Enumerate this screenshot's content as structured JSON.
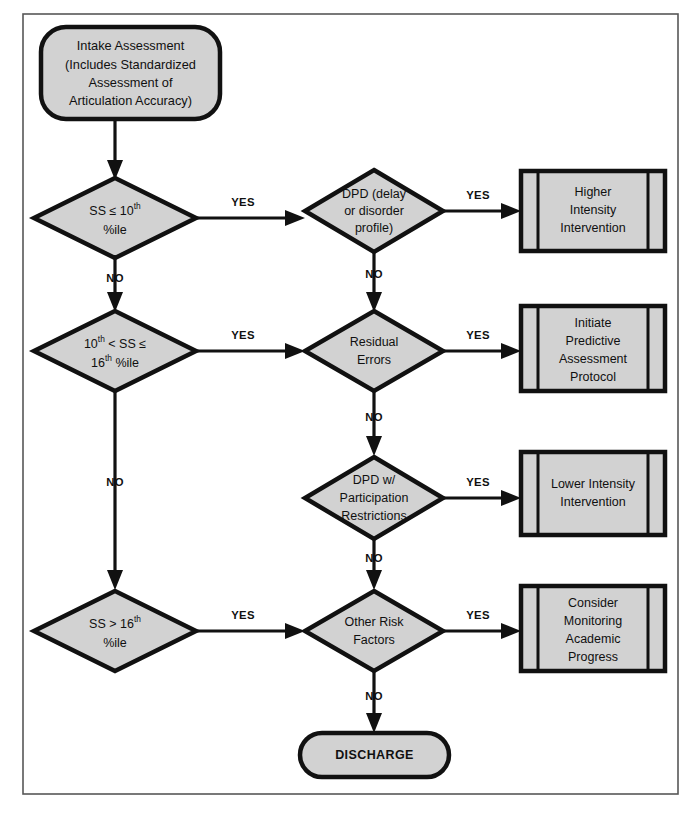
{
  "diagram": {
    "frame": {
      "stroke_color": "#575757"
    },
    "style": {
      "node_fill": "#d2d2d2",
      "node_stroke": "#111111",
      "background": "#ffffff",
      "edge_color": "#111111",
      "text_color": "#101010"
    },
    "nodes": [
      {
        "id": "intake",
        "type": "terminator",
        "lines": [
          "Intake Assessment",
          "(Includes Standardized",
          "Assessment of",
          "Articulation Accuracy)"
        ]
      },
      {
        "id": "d1",
        "type": "decision",
        "lines": [
          "SS ≤ 10th",
          "%ile"
        ],
        "rich": [
          {
            "parts": [
              {
                "t": "SS ≤ 10",
                "sup": false
              },
              {
                "t": "th",
                "sup": true
              }
            ]
          },
          {
            "parts": [
              {
                "t": "%ile",
                "sup": false
              }
            ]
          }
        ]
      },
      {
        "id": "d2",
        "type": "decision",
        "lines": [
          "DPD (delay",
          "or disorder",
          "profile)"
        ]
      },
      {
        "id": "p1",
        "type": "predefined-process",
        "lines": [
          "Higher",
          "Intensity",
          "Intervention"
        ]
      },
      {
        "id": "d3",
        "type": "decision",
        "lines": [
          "10th < SS ≤",
          "16th %ile"
        ],
        "rich": [
          {
            "parts": [
              {
                "t": "10",
                "sup": false
              },
              {
                "t": "th",
                "sup": true
              },
              {
                "t": " < SS ≤",
                "sup": false
              }
            ]
          },
          {
            "parts": [
              {
                "t": "16",
                "sup": false
              },
              {
                "t": "th",
                "sup": true
              },
              {
                "t": " %ile",
                "sup": false
              }
            ]
          }
        ]
      },
      {
        "id": "d4",
        "type": "decision",
        "lines": [
          "Residual",
          "Errors"
        ]
      },
      {
        "id": "p2",
        "type": "predefined-process",
        "lines": [
          "Initiate",
          "Predictive",
          "Assessment",
          "Protocol"
        ]
      },
      {
        "id": "d5",
        "type": "decision",
        "lines": [
          "DPD w/",
          "Participation",
          "Restrictions"
        ]
      },
      {
        "id": "p3",
        "type": "predefined-process",
        "lines": [
          "Lower Intensity",
          "Intervention"
        ]
      },
      {
        "id": "d6",
        "type": "decision",
        "lines": [
          "SS > 16th",
          "%ile"
        ],
        "rich": [
          {
            "parts": [
              {
                "t": "SS > 16",
                "sup": false
              },
              {
                "t": "th",
                "sup": true
              }
            ]
          },
          {
            "parts": [
              {
                "t": "%ile",
                "sup": false
              }
            ]
          }
        ]
      },
      {
        "id": "d7",
        "type": "decision",
        "lines": [
          "Other Risk",
          "Factors"
        ]
      },
      {
        "id": "p4",
        "type": "predefined-process",
        "lines": [
          "Consider",
          "Monitoring",
          "Academic",
          "Progress"
        ]
      },
      {
        "id": "discharge",
        "type": "terminator",
        "lines": [
          "DISCHARGE"
        ]
      }
    ],
    "edge_labels": {
      "yes": "YES",
      "no": "NO"
    },
    "edges": [
      {
        "from": "intake",
        "to": "d1",
        "label": ""
      },
      {
        "from": "d1",
        "to": "d2",
        "label": "YES"
      },
      {
        "from": "d2",
        "to": "p1",
        "label": "YES"
      },
      {
        "from": "d1",
        "to": "d3",
        "label": "NO"
      },
      {
        "from": "d2",
        "to": "d4",
        "label": "NO"
      },
      {
        "from": "d3",
        "to": "d4",
        "label": "YES"
      },
      {
        "from": "d4",
        "to": "p2",
        "label": "YES"
      },
      {
        "from": "d4",
        "to": "d5",
        "label": "NO"
      },
      {
        "from": "d5",
        "to": "p3",
        "label": "YES"
      },
      {
        "from": "d5",
        "to": "d7",
        "label": "NO"
      },
      {
        "from": "d3",
        "to": "d6",
        "label": "NO"
      },
      {
        "from": "d6",
        "to": "d7",
        "label": "YES"
      },
      {
        "from": "d7",
        "to": "p4",
        "label": "YES"
      },
      {
        "from": "d7",
        "to": "discharge",
        "label": "NO"
      }
    ],
    "labels": {
      "intake_l1": "Intake Assessment",
      "intake_l2": "(Includes Standardized",
      "intake_l3": "Assessment of",
      "intake_l4": "Articulation Accuracy)",
      "d1_l1_a": "SS ≤ 10",
      "d1_l1_sup": "th",
      "d1_l2": "%ile",
      "d2_l1": "DPD (delay",
      "d2_l2": "or disorder",
      "d2_l3": "profile)",
      "p1_l1": "Higher",
      "p1_l2": "Intensity",
      "p1_l3": "Intervention",
      "d3_l1_a": "10",
      "d3_l1_sup": "th",
      "d3_l1_b": " < SS ≤",
      "d3_l2_a": "16",
      "d3_l2_sup": "th",
      "d3_l2_b": " %ile",
      "d4_l1": "Residual",
      "d4_l2": "Errors",
      "p2_l1": "Initiate",
      "p2_l2": "Predictive",
      "p2_l3": "Assessment",
      "p2_l4": "Protocol",
      "d5_l1": "DPD w/",
      "d5_l2": "Participation",
      "d5_l3": "Restrictions",
      "p3_l1": "Lower Intensity",
      "p3_l2": "Intervention",
      "d6_l1_a": "SS > 16",
      "d6_l1_sup": "th",
      "d6_l2": "%ile",
      "d7_l1": "Other Risk",
      "d7_l2": "Factors",
      "p4_l1": "Consider",
      "p4_l2": "Monitoring",
      "p4_l3": "Academic",
      "p4_l4": "Progress",
      "discharge": "DISCHARGE",
      "yes1": "YES",
      "yes2": "YES",
      "yes3": "YES",
      "yes4": "YES",
      "yes5": "YES",
      "yes6": "YES",
      "yes7": "YES",
      "no1": "NO",
      "no2": "NO",
      "no3": "NO",
      "no4": "NO",
      "no5": "NO",
      "no6": "NO"
    }
  }
}
